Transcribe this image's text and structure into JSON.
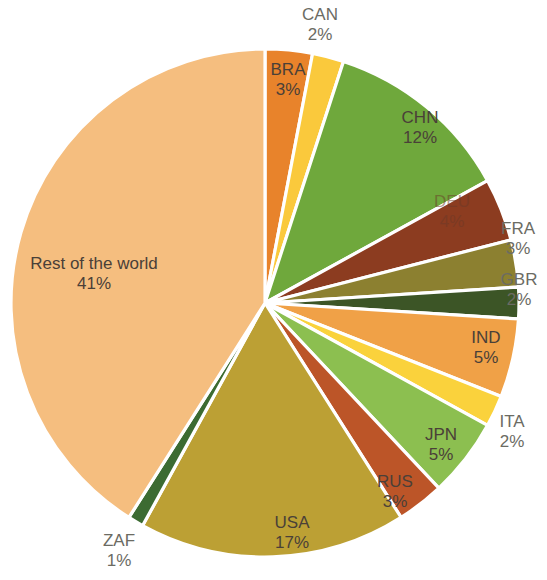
{
  "chart_data": {
    "type": "pie",
    "title": "",
    "subtitle": "",
    "xlabel": "",
    "ylabel": "",
    "legend_position": "none",
    "grid": false,
    "value_unit": "%",
    "total": 100,
    "categories": [
      "BRA",
      "CAN",
      "CHN",
      "DEU",
      "FRA",
      "GBR",
      "IND",
      "ITA",
      "JPN",
      "RUS",
      "USA",
      "ZAF",
      "Rest of the world"
    ],
    "values": [
      3,
      2,
      12,
      4,
      3,
      2,
      5,
      2,
      5,
      3,
      17,
      1,
      41
    ],
    "slices": [
      {
        "label": "BRA",
        "value": 3,
        "value_text": "3%",
        "color": "#E8832B",
        "start_angle": 0,
        "end_angle": 10.8,
        "label_x": 288,
        "label_y": 80,
        "label_placement": "inside"
      },
      {
        "label": "CAN",
        "value": 2,
        "value_text": "2%",
        "color": "#FAC93C",
        "start_angle": 10.8,
        "end_angle": 18.0,
        "label_x": 320,
        "label_y": 25,
        "label_placement": "outside"
      },
      {
        "label": "CHN",
        "value": 12,
        "value_text": "12%",
        "color": "#6FA83C",
        "start_angle": 18.0,
        "end_angle": 61.2,
        "label_x": 420,
        "label_y": 128,
        "label_placement": "inside"
      },
      {
        "label": "DEU",
        "value": 4,
        "value_text": "4%",
        "color": "#8C3C20",
        "start_angle": 61.2,
        "end_angle": 75.6,
        "label_x": 452,
        "label_y": 212,
        "label_placement": "inside-faint"
      },
      {
        "label": "FRA",
        "value": 3,
        "value_text": "3%",
        "color": "#8C8030",
        "start_angle": 75.6,
        "end_angle": 86.4,
        "label_x": 518,
        "label_y": 239,
        "label_placement": "outside"
      },
      {
        "label": "GBR",
        "value": 2,
        "value_text": "2%",
        "color": "#3C5526",
        "start_angle": 86.4,
        "end_angle": 93.6,
        "label_x": 519,
        "label_y": 290,
        "label_placement": "outside"
      },
      {
        "label": "IND",
        "value": 5,
        "value_text": "5%",
        "color": "#F0A147",
        "start_angle": 93.6,
        "end_angle": 111.6,
        "label_x": 486,
        "label_y": 348,
        "label_placement": "inside"
      },
      {
        "label": "ITA",
        "value": 2,
        "value_text": "2%",
        "color": "#FAD23C",
        "start_angle": 111.6,
        "end_angle": 118.8,
        "label_x": 512,
        "label_y": 432,
        "label_placement": "outside"
      },
      {
        "label": "JPN",
        "value": 5,
        "value_text": "5%",
        "color": "#8CBF50",
        "start_angle": 118.8,
        "end_angle": 136.8,
        "label_x": 441,
        "label_y": 445,
        "label_placement": "inside"
      },
      {
        "label": "RUS",
        "value": 3,
        "value_text": "3%",
        "color": "#BC5528",
        "start_angle": 136.8,
        "end_angle": 147.6,
        "label_x": 395,
        "label_y": 492,
        "label_placement": "inside"
      },
      {
        "label": "USA",
        "value": 17,
        "value_text": "17%",
        "color": "#BCA034",
        "start_angle": 147.6,
        "end_angle": 208.8,
        "label_x": 292,
        "label_y": 533,
        "label_placement": "inside"
      },
      {
        "label": "ZAF",
        "value": 1,
        "value_text": "1%",
        "color": "#3C6B32",
        "start_angle": 208.8,
        "end_angle": 212.4,
        "label_x": 119,
        "label_y": 551,
        "label_placement": "outside"
      },
      {
        "label": "Rest of the world",
        "value": 41,
        "value_text": "41%",
        "color": "#F5BE7F",
        "start_angle": 212.4,
        "end_angle": 360,
        "label_x": 94,
        "label_y": 274,
        "label_placement": "inside"
      }
    ],
    "geometry": {
      "center_x": 265,
      "center_y": 303,
      "radius": 254
    }
  }
}
